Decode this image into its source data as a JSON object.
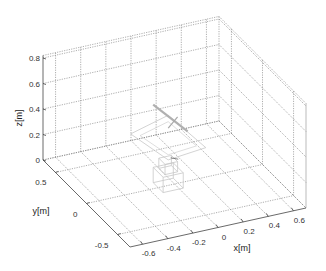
{
  "chart_data": {
    "type": "3d-wireframe",
    "title": "",
    "xlabel": "x[m]",
    "ylabel": "y[m]",
    "zlabel": "z[m]",
    "xlim": [
      -0.7,
      0.7
    ],
    "ylim": [
      -0.7,
      0.7
    ],
    "zlim": [
      0,
      0.82
    ],
    "xticks": [
      -0.6,
      -0.4,
      -0.2,
      0,
      0.2,
      0.4,
      0.6
    ],
    "xtick_labels": [
      "-0.6",
      "-0.4",
      "-0.2",
      "0",
      "0.2",
      "0.4",
      "0.6"
    ],
    "yticks": [
      -0.5,
      0,
      0.5
    ],
    "ytick_labels": [
      "-0.5",
      "0",
      "0.5"
    ],
    "zticks": [
      0,
      0.2,
      0.4,
      0.6,
      0.8
    ],
    "ztick_labels": [
      "0",
      "0.2",
      "0.4",
      "0.6",
      "0.8"
    ],
    "grid": true,
    "grid_style": "dotted",
    "content": "faint wireframe of a robot/manipulator near origin, link extending up to about z=0.5",
    "colors": {
      "axis": "#444444",
      "grid": "#777777",
      "object": "#c8c8c8"
    }
  }
}
